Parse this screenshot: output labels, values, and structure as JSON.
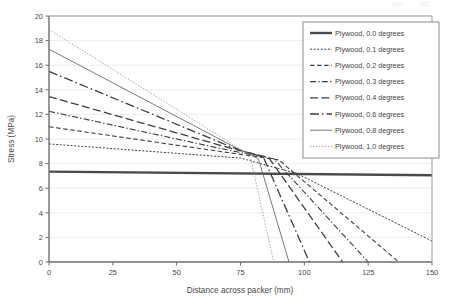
{
  "chart_data": {
    "type": "line",
    "title": "",
    "xlabel": "Distance across packer (mm)",
    "ylabel": "Stress (MPa)",
    "xlim": [
      0,
      150
    ],
    "ylim": [
      0,
      20
    ],
    "xticks": [
      0,
      25,
      50,
      75,
      100,
      125,
      150
    ],
    "yticks": [
      0,
      2,
      4,
      6,
      8,
      10,
      12,
      14,
      16,
      18,
      20
    ],
    "grid": true,
    "grid_axis": "y",
    "legend_position": "top-right",
    "series": [
      {
        "name": "Plywood, 0.0 degrees",
        "dash": "solid",
        "width": 2.4,
        "color": "#4a4a4a",
        "points": [
          [
            0,
            7.35
          ],
          [
            150,
            7.05
          ]
        ]
      },
      {
        "name": "Plywood, 0.1 degrees",
        "dash": "dotted",
        "width": 1.0,
        "color": "#3f3f3f",
        "points": [
          [
            0,
            9.6
          ],
          [
            75,
            8.45
          ],
          [
            97,
            7.2
          ],
          [
            150,
            1.7
          ]
        ]
      },
      {
        "name": "Plywood, 0.2 degrees",
        "dash": "dashed",
        "width": 1.1,
        "color": "#3f3f3f",
        "points": [
          [
            0,
            11.0
          ],
          [
            70,
            8.9
          ],
          [
            90,
            8.3
          ],
          [
            137,
            0
          ]
        ]
      },
      {
        "name": "Plywood, 0.3 degrees",
        "dash": "dashdot",
        "width": 1.1,
        "color": "#3f3f3f",
        "points": [
          [
            0,
            12.25
          ],
          [
            70,
            9.1
          ],
          [
            88,
            8.4
          ],
          [
            125,
            0
          ]
        ]
      },
      {
        "name": "Plywood, 0.4 degrees",
        "dash": "longdash",
        "width": 1.3,
        "color": "#3f3f3f",
        "points": [
          [
            0,
            13.45
          ],
          [
            72,
            9.2
          ],
          [
            86,
            8.5
          ],
          [
            115,
            0
          ]
        ]
      },
      {
        "name": "Plywood, 0.6 degrees",
        "dash": "longdashdot",
        "width": 1.3,
        "color": "#3f3f3f",
        "points": [
          [
            0,
            15.5
          ],
          [
            72,
            9.3
          ],
          [
            84,
            8.5
          ],
          [
            102,
            0
          ]
        ]
      },
      {
        "name": "Plywood, 0.8 degrees",
        "dash": "solid",
        "width": 0.9,
        "color": "#6a6a6a",
        "points": [
          [
            0,
            17.3
          ],
          [
            74,
            9.2
          ],
          [
            82,
            8.4
          ],
          [
            94,
            0
          ]
        ]
      },
      {
        "name": "Plywood, 1.0 degrees",
        "dash": "finedot",
        "width": 0.9,
        "color": "#9a9a9a",
        "points": [
          [
            0,
            18.9
          ],
          [
            74,
            9.3
          ],
          [
            79,
            8.4
          ],
          [
            88,
            0
          ]
        ]
      }
    ]
  },
  "axes": {
    "x_tick_labels": [
      "0",
      "25",
      "50",
      "75",
      "100",
      "125",
      "150"
    ],
    "y_tick_labels": [
      "0",
      "2",
      "4",
      "6",
      "8",
      "10",
      "12",
      "14",
      "16",
      "18",
      "20"
    ],
    "x_axis_title": "Distance across packer (mm)",
    "y_axis_title": "Stress (MPa)"
  },
  "legend": {
    "entries": [
      "Plywood, 0.0 degrees",
      "Plywood, 0.1 degrees",
      "Plywood, 0.2 degrees",
      "Plywood, 0.3 degrees",
      "Plywood, 0.4 degrees",
      "Plywood, 0.6 degrees",
      "Plywood, 0.8 degrees",
      "Plywood, 1.0 degrees"
    ]
  }
}
